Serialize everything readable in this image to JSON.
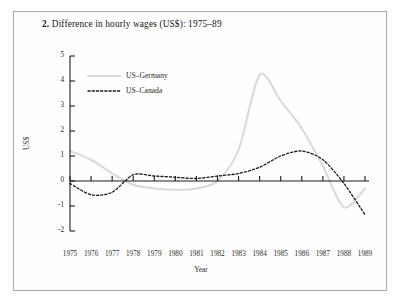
{
  "figure": {
    "number": "2.",
    "title": "Difference in hourly wages (US$): 1975–89",
    "border_color": "#a8a8a8",
    "background": "#fefefe"
  },
  "chart_data": {
    "type": "line",
    "title": "Difference in hourly wages (US$): 1975–89",
    "xlabel": "Year",
    "ylabel": "US$",
    "categories": [
      "1975",
      "1976",
      "1977",
      "1978",
      "1979",
      "1980",
      "1981",
      "1982",
      "1983",
      "1984",
      "1985",
      "1986",
      "1987",
      "1988",
      "1989"
    ],
    "x": [
      1975,
      1976,
      1977,
      1978,
      1979,
      1980,
      1981,
      1982,
      1983,
      1984,
      1985,
      1986,
      1987,
      1988,
      1989
    ],
    "xlim": [
      1974.6,
      1989.6
    ],
    "ylim": [
      -2,
      5
    ],
    "yticks": [
      -2,
      -1,
      0,
      1,
      2,
      3,
      4,
      5
    ],
    "ytick_labels": [
      "-2",
      "-1",
      "0",
      "1",
      "2",
      "3",
      "4",
      "5"
    ],
    "grid": false,
    "legend_position": "top-left-inside",
    "zero_line": true,
    "series": [
      {
        "name": "US–Germany",
        "color": "#d9d9d9",
        "style": "solid",
        "width": 2.0,
        "values": [
          1.2,
          0.85,
          0.3,
          -0.15,
          -0.3,
          -0.35,
          -0.3,
          0.0,
          1.25,
          4.25,
          3.2,
          2.1,
          0.6,
          -1.05,
          -0.3
        ]
      },
      {
        "name": "US–Canada",
        "color": "#1a1a1a",
        "style": "dotted",
        "width": 1.3,
        "values": [
          -0.1,
          -0.55,
          -0.45,
          0.25,
          0.2,
          0.15,
          0.1,
          0.2,
          0.3,
          0.55,
          1.0,
          1.2,
          0.85,
          -0.1,
          -1.35
        ]
      }
    ]
  },
  "legend": {
    "items": [
      {
        "label": "US–Germany",
        "color": "#d9d9d9",
        "style": "solid"
      },
      {
        "label": "US–Canada",
        "color": "#1a1a1a",
        "style": "dotted"
      }
    ]
  }
}
